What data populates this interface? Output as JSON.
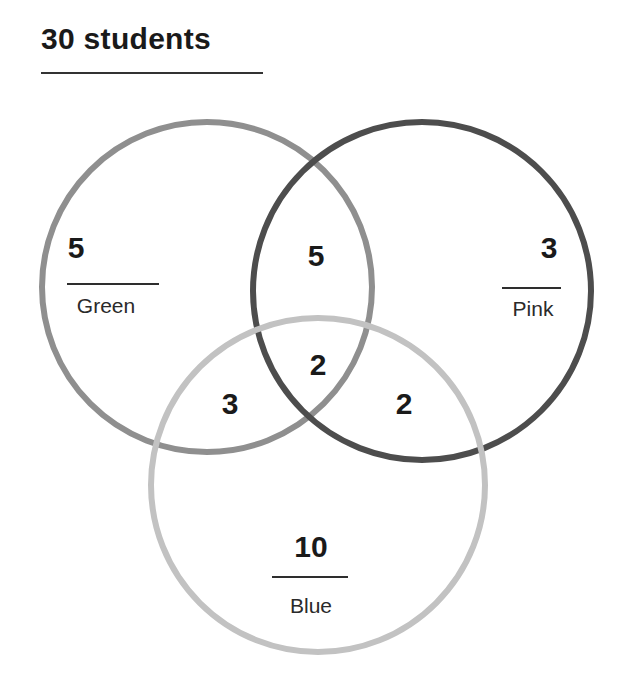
{
  "title": "30 students",
  "diagram": {
    "type": "venn-3",
    "total": 30,
    "sets": [
      {
        "name": "Green",
        "only_count": "5",
        "stroke": "#8f8f8f"
      },
      {
        "name": "Pink",
        "only_count": "3",
        "stroke": "#4d4d4d"
      },
      {
        "name": "Blue",
        "only_count": "10",
        "stroke": "#c2c2c2"
      }
    ],
    "regions": {
      "green_only": "5",
      "pink_only": "3",
      "blue_only": "10",
      "green_pink": "5",
      "green_blue": "3",
      "pink_blue": "2",
      "all_three": "2"
    }
  }
}
